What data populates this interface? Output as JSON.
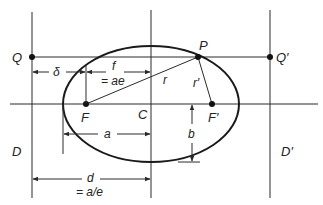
{
  "diagram": {
    "colors": {
      "stroke": "#2a2a2a",
      "ellipse": "#1a1a1a",
      "background": "#ffffff"
    },
    "points": {
      "Q": "Q",
      "Q_prime": "Q′",
      "P": "P",
      "F": "F",
      "F_prime": "F′",
      "C": "C"
    },
    "lines": {
      "D": "D",
      "D_prime": "D′"
    },
    "segments": {
      "r": "r",
      "r_prime": "r′"
    },
    "dimensions": {
      "delta": "δ",
      "f": "f",
      "f_eq": "= ae",
      "a": "a",
      "b": "b",
      "d": "d",
      "d_eq": "= a/e"
    }
  }
}
